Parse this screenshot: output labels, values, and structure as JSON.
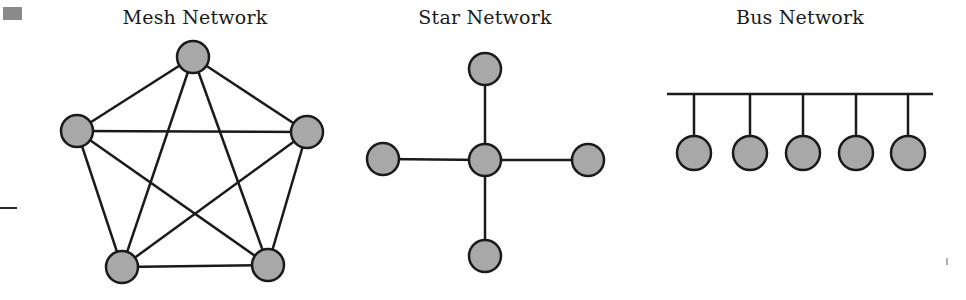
{
  "page": {
    "width": 966,
    "height": 300,
    "background": "#ffffff"
  },
  "style": {
    "node_fill": "#a8a8a8",
    "node_stroke": "#1a1a1a",
    "node_stroke_width": 2.5,
    "link_color": "#1a1a1a",
    "link_width": 2.5,
    "title_color": "#1a1a1a",
    "artifact_gray": "#8a8a8a"
  },
  "diagrams": [
    {
      "id": "mesh",
      "title": "Mesh Network",
      "type": "mesh",
      "node_radius": 16,
      "nodes": [
        {
          "name": "mesh-node-top",
          "cx": 193,
          "cy": 57
        },
        {
          "name": "mesh-node-left",
          "cx": 77,
          "cy": 131
        },
        {
          "name": "mesh-node-right",
          "cx": 307,
          "cy": 132
        },
        {
          "name": "mesh-node-bottom-left",
          "cx": 122,
          "cy": 267
        },
        {
          "name": "mesh-node-bottom-right",
          "cx": 268,
          "cy": 265
        }
      ],
      "edges": [
        [
          0,
          1
        ],
        [
          0,
          2
        ],
        [
          0,
          3
        ],
        [
          0,
          4
        ],
        [
          1,
          2
        ],
        [
          1,
          3
        ],
        [
          1,
          4
        ],
        [
          2,
          3
        ],
        [
          2,
          4
        ],
        [
          3,
          4
        ]
      ],
      "edge_count": 10
    },
    {
      "id": "star",
      "title": "Star Network",
      "type": "star",
      "node_radius": 16,
      "nodes": [
        {
          "name": "star-node-hub",
          "cx": 485,
          "cy": 160
        },
        {
          "name": "star-node-top",
          "cx": 485,
          "cy": 69
        },
        {
          "name": "star-node-left",
          "cx": 383,
          "cy": 159
        },
        {
          "name": "star-node-right",
          "cx": 588,
          "cy": 160
        },
        {
          "name": "star-node-bottom",
          "cx": 485,
          "cy": 256
        }
      ],
      "edges": [
        [
          0,
          1
        ],
        [
          0,
          2
        ],
        [
          0,
          3
        ],
        [
          0,
          4
        ]
      ],
      "edge_count": 4
    },
    {
      "id": "bus",
      "title": "Bus Network",
      "type": "bus",
      "node_radius": 17,
      "backbone": {
        "x1": 667,
        "x2": 933,
        "y": 94
      },
      "nodes": [
        {
          "name": "bus-node-1",
          "cx": 694,
          "cy": 153
        },
        {
          "name": "bus-node-2",
          "cx": 750,
          "cy": 153
        },
        {
          "name": "bus-node-3",
          "cx": 803,
          "cy": 153
        },
        {
          "name": "bus-node-4",
          "cx": 856,
          "cy": 153
        },
        {
          "name": "bus-node-5",
          "cx": 908,
          "cy": 153
        }
      ],
      "edge_count": 5
    }
  ],
  "chart_data": {
    "type": "diagram",
    "panels": [
      {
        "label": "Mesh Network",
        "topology": "full-mesh",
        "node_count": 5,
        "link_count": 10,
        "description": "Five nodes in a pentagon, every node connected to every other node"
      },
      {
        "label": "Star Network",
        "topology": "star",
        "node_count": 5,
        "link_count": 4,
        "description": "Central hub node with four leaf nodes connected to it"
      },
      {
        "label": "Bus Network",
        "topology": "bus",
        "node_count": 5,
        "link_count": 5,
        "description": "Five nodes dropping from a shared horizontal backbone line"
      }
    ]
  }
}
